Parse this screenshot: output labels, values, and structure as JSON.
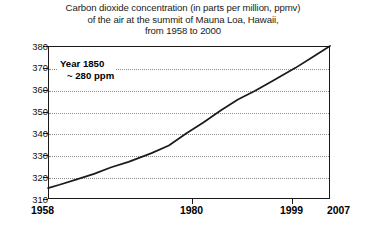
{
  "title": {
    "line1": "Carbon dioxide concentration (in parts per million, ppmv)",
    "line2": "of the air at the summit of Mauna Loa, Hawaii,",
    "line3": "from 1958 to 2000"
  },
  "annotation": {
    "line1": "Year 1850",
    "line2": "~ 280 ppm"
  },
  "axis": {
    "y_labels": [
      "380",
      "370",
      "360",
      "350",
      "340",
      "330",
      "320",
      "310"
    ],
    "x_labels": [
      "1958",
      "1980",
      "1999",
      "2007"
    ]
  },
  "colors": {
    "line": "#1a1a1a",
    "grid": "#8c8c8c",
    "axis": "#1a1a1a",
    "background": "#ffffff",
    "text": "#000000"
  },
  "chart_data": {
    "type": "line",
    "title": "Carbon dioxide concentration (in parts per million, ppmv) of the air at the summit of Mauna Loa, Hawaii, from 1958 to 2000",
    "xlabel": "",
    "ylabel": "",
    "xlim": [
      1958,
      2007
    ],
    "ylim": [
      310,
      380
    ],
    "yticks": [
      310,
      320,
      330,
      340,
      350,
      360,
      370,
      380
    ],
    "xticks": [
      1958,
      1980,
      1999,
      2007
    ],
    "grid": "horizontal-dotted",
    "legend": "none",
    "annotations": [
      {
        "text": "Year 1850 ~ 280 ppm",
        "x": 1962,
        "y": 370
      }
    ],
    "series": [
      {
        "name": "CO2 concentration (ppmv)",
        "x": [
          1958,
          1960,
          1963,
          1966,
          1969,
          1972,
          1976,
          1979,
          1982,
          1985,
          1988,
          1991,
          1994,
          1997,
          2001,
          2004,
          2007
        ],
        "values": [
          315.0,
          316.5,
          319.0,
          321.5,
          324.5,
          327.0,
          331.0,
          334.5,
          340.0,
          345.0,
          350.5,
          355.5,
          359.5,
          364.0,
          370.0,
          375.0,
          380.0
        ]
      }
    ]
  }
}
